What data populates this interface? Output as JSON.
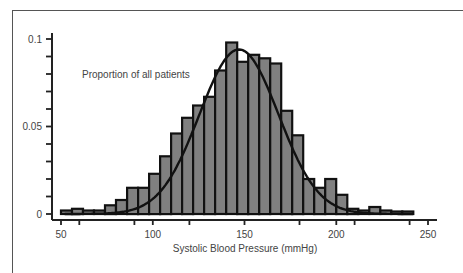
{
  "chart_data": {
    "type": "bar",
    "title": "",
    "annotation": "Proportion of all patients",
    "xlabel": "Systolic Blood Pressure (mmHg)",
    "ylabel": "Proportion of all patients",
    "xlim": [
      50,
      250
    ],
    "ylim": [
      0,
      0.1
    ],
    "x_ticks": [
      50,
      100,
      150,
      200,
      250
    ],
    "y_ticks": [
      0,
      0.05,
      0.1
    ],
    "y_tick_labels": [
      "0",
      "0.05",
      "0.1"
    ],
    "x_tick_labels": [
      "50",
      "100",
      "150",
      "200",
      "250"
    ],
    "bin_width": 6,
    "bins": [
      {
        "x0": 50,
        "x1": 56,
        "value": 0.002
      },
      {
        "x0": 56,
        "x1": 62,
        "value": 0.003
      },
      {
        "x0": 62,
        "x1": 68,
        "value": 0.002
      },
      {
        "x0": 68,
        "x1": 74,
        "value": 0.002
      },
      {
        "x0": 74,
        "x1": 80,
        "value": 0.005
      },
      {
        "x0": 80,
        "x1": 86,
        "value": 0.008
      },
      {
        "x0": 86,
        "x1": 92,
        "value": 0.015
      },
      {
        "x0": 92,
        "x1": 98,
        "value": 0.015
      },
      {
        "x0": 98,
        "x1": 104,
        "value": 0.023
      },
      {
        "x0": 104,
        "x1": 110,
        "value": 0.033
      },
      {
        "x0": 110,
        "x1": 116,
        "value": 0.046
      },
      {
        "x0": 116,
        "x1": 122,
        "value": 0.055
      },
      {
        "x0": 122,
        "x1": 128,
        "value": 0.062
      },
      {
        "x0": 128,
        "x1": 134,
        "value": 0.067
      },
      {
        "x0": 134,
        "x1": 140,
        "value": 0.082
      },
      {
        "x0": 140,
        "x1": 146,
        "value": 0.098
      },
      {
        "x0": 146,
        "x1": 152,
        "value": 0.087
      },
      {
        "x0": 152,
        "x1": 158,
        "value": 0.091
      },
      {
        "x0": 158,
        "x1": 164,
        "value": 0.089
      },
      {
        "x0": 164,
        "x1": 170,
        "value": 0.086
      },
      {
        "x0": 170,
        "x1": 176,
        "value": 0.059
      },
      {
        "x0": 176,
        "x1": 182,
        "value": 0.045
      },
      {
        "x0": 182,
        "x1": 188,
        "value": 0.02
      },
      {
        "x0": 188,
        "x1": 194,
        "value": 0.015
      },
      {
        "x0": 194,
        "x1": 200,
        "value": 0.02
      },
      {
        "x0": 200,
        "x1": 206,
        "value": 0.011
      },
      {
        "x0": 206,
        "x1": 212,
        "value": 0.003
      },
      {
        "x0": 212,
        "x1": 218,
        "value": 0.002
      },
      {
        "x0": 218,
        "x1": 224,
        "value": 0.004
      },
      {
        "x0": 224,
        "x1": 230,
        "value": 0.002
      },
      {
        "x0": 230,
        "x1": 236,
        "value": 0.001
      },
      {
        "x0": 236,
        "x1": 242,
        "value": 0.001
      }
    ],
    "series": [
      {
        "name": "Histogram",
        "type": "bar",
        "color": "#808080",
        "edgecolor": "#111111"
      },
      {
        "name": "Normal fit",
        "type": "line",
        "color": "#111111",
        "mean": 147,
        "sd": 21.5,
        "peak": 0.094
      }
    ],
    "grid": false,
    "legend": null
  },
  "axes": {
    "x_label": "Systolic Blood Pressure (mmHg)",
    "annotation": "Proportion of all patients"
  }
}
